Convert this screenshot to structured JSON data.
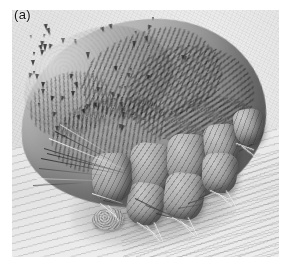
{
  "figure": {
    "panel_label": "(a)",
    "caption_visible": "",
    "image_type": "scanning-electron-micrograph",
    "rendering": "grayscale",
    "background_color": "#ffffff",
    "plate_tone_color": "#f0f0f0",
    "specimen_mid_tone": "#9a9a9a",
    "specimen_shadow_color": "#4a4a4a",
    "label_color": "#141414",
    "features": [
      {
        "name": "dorsal-shield",
        "description": "granular cuticle bearing triangular spines"
      },
      {
        "name": "cuticular-striations",
        "description": "parallel ridged folds across idiosoma"
      },
      {
        "name": "legs",
        "description": "segmented jointed legs with tarsal claws"
      },
      {
        "name": "setae",
        "description": "long whip-like bristles projecting from body margin"
      },
      {
        "name": "debris-particle",
        "description": "granular particle on substrate"
      },
      {
        "name": "substrate",
        "description": "striated skin surface beneath specimen"
      }
    ],
    "spine_count_visible": 58,
    "leg_count_visible": 4
  }
}
